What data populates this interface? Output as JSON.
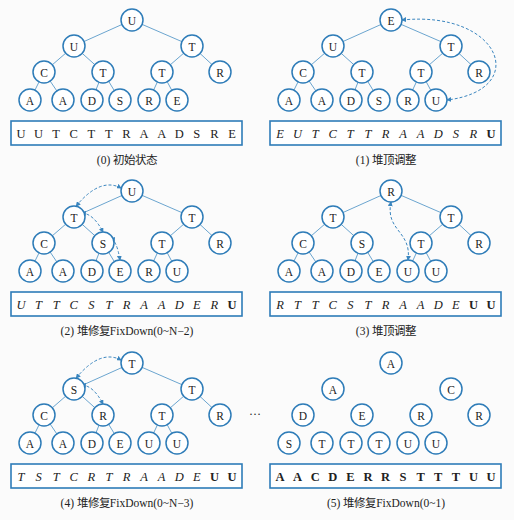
{
  "colors": {
    "node_stroke": "#2e7cb8",
    "edge": "#5a9bc9",
    "text": "#222222"
  },
  "ellipsis": "…",
  "panels": [
    {
      "id": 0,
      "caption": "(0) 初始状态",
      "nodes": [
        "U",
        "U",
        "T",
        "C",
        "T",
        "T",
        "R",
        "A",
        "A",
        "D",
        "S",
        "R",
        "E"
      ],
      "show_edges": true,
      "array": [
        {
          "v": "U",
          "s": "normal"
        },
        {
          "v": "U",
          "s": "normal"
        },
        {
          "v": "T",
          "s": "normal"
        },
        {
          "v": "C",
          "s": "normal"
        },
        {
          "v": "T",
          "s": "normal"
        },
        {
          "v": "T",
          "s": "normal"
        },
        {
          "v": "R",
          "s": "normal"
        },
        {
          "v": "A",
          "s": "normal"
        },
        {
          "v": "A",
          "s": "normal"
        },
        {
          "v": "D",
          "s": "normal"
        },
        {
          "v": "S",
          "s": "normal"
        },
        {
          "v": "R",
          "s": "normal"
        },
        {
          "v": "E",
          "s": "normal"
        }
      ],
      "swaps": []
    },
    {
      "id": 1,
      "caption": "(1) 堆顶调整",
      "nodes": [
        "E",
        "U",
        "T",
        "C",
        "T",
        "T",
        "R",
        "A",
        "A",
        "D",
        "S",
        "R",
        "U"
      ],
      "show_edges": true,
      "array": [
        {
          "v": "E",
          "s": "italic"
        },
        {
          "v": "U",
          "s": "italic"
        },
        {
          "v": "T",
          "s": "italic"
        },
        {
          "v": "C",
          "s": "italic"
        },
        {
          "v": "T",
          "s": "italic"
        },
        {
          "v": "T",
          "s": "italic"
        },
        {
          "v": "R",
          "s": "italic"
        },
        {
          "v": "A",
          "s": "italic"
        },
        {
          "v": "A",
          "s": "italic"
        },
        {
          "v": "D",
          "s": "italic"
        },
        {
          "v": "S",
          "s": "italic"
        },
        {
          "v": "R",
          "s": "italic"
        },
        {
          "v": "U",
          "s": "bold"
        }
      ],
      "swaps": [
        [
          0,
          12
        ]
      ]
    },
    {
      "id": 2,
      "caption": "(2) 堆修复FixDown(0~N−2)",
      "nodes": [
        "U",
        "T",
        "T",
        "C",
        "S",
        "T",
        "R",
        "A",
        "A",
        "D",
        "E",
        "R",
        "U"
      ],
      "show_edges": true,
      "array": [
        {
          "v": "U",
          "s": "italic"
        },
        {
          "v": "T",
          "s": "italic"
        },
        {
          "v": "T",
          "s": "italic"
        },
        {
          "v": "C",
          "s": "italic"
        },
        {
          "v": "S",
          "s": "italic"
        },
        {
          "v": "T",
          "s": "italic"
        },
        {
          "v": "R",
          "s": "italic"
        },
        {
          "v": "A",
          "s": "italic"
        },
        {
          "v": "A",
          "s": "italic"
        },
        {
          "v": "D",
          "s": "italic"
        },
        {
          "v": "E",
          "s": "italic"
        },
        {
          "v": "R",
          "s": "italic"
        },
        {
          "v": "U",
          "s": "bold"
        }
      ],
      "swaps": [
        [
          0,
          1
        ],
        [
          1,
          4
        ],
        [
          4,
          10
        ]
      ]
    },
    {
      "id": 3,
      "caption": "(3) 堆顶调整",
      "nodes": [
        "R",
        "T",
        "T",
        "C",
        "S",
        "T",
        "R",
        "A",
        "A",
        "D",
        "E",
        "U",
        "U"
      ],
      "show_edges": true,
      "array": [
        {
          "v": "R",
          "s": "italic"
        },
        {
          "v": "T",
          "s": "italic"
        },
        {
          "v": "T",
          "s": "italic"
        },
        {
          "v": "C",
          "s": "italic"
        },
        {
          "v": "S",
          "s": "italic"
        },
        {
          "v": "T",
          "s": "italic"
        },
        {
          "v": "R",
          "s": "italic"
        },
        {
          "v": "A",
          "s": "italic"
        },
        {
          "v": "A",
          "s": "italic"
        },
        {
          "v": "D",
          "s": "italic"
        },
        {
          "v": "E",
          "s": "italic"
        },
        {
          "v": "U",
          "s": "bold"
        },
        {
          "v": "U",
          "s": "bold"
        }
      ],
      "swaps": [
        [
          0,
          11
        ]
      ]
    },
    {
      "id": 4,
      "caption": "(4) 堆修复FixDown(0~N−3)",
      "nodes": [
        "T",
        "S",
        "T",
        "C",
        "R",
        "T",
        "R",
        "A",
        "A",
        "D",
        "E",
        "U",
        "U"
      ],
      "show_edges": true,
      "array": [
        {
          "v": "T",
          "s": "italic"
        },
        {
          "v": "S",
          "s": "italic"
        },
        {
          "v": "T",
          "s": "italic"
        },
        {
          "v": "C",
          "s": "italic"
        },
        {
          "v": "R",
          "s": "italic"
        },
        {
          "v": "T",
          "s": "italic"
        },
        {
          "v": "R",
          "s": "italic"
        },
        {
          "v": "A",
          "s": "italic"
        },
        {
          "v": "A",
          "s": "italic"
        },
        {
          "v": "D",
          "s": "italic"
        },
        {
          "v": "E",
          "s": "italic"
        },
        {
          "v": "U",
          "s": "bold"
        },
        {
          "v": "U",
          "s": "bold"
        }
      ],
      "swaps": [
        [
          0,
          1
        ],
        [
          1,
          4
        ]
      ]
    },
    {
      "id": 5,
      "caption": "(5) 堆修复FixDown(0~1)",
      "nodes": [
        "A",
        "A",
        "C",
        "D",
        "E",
        "R",
        "R",
        "S",
        "T",
        "T",
        "T",
        "U",
        "U"
      ],
      "show_edges": false,
      "array": [
        {
          "v": "A",
          "s": "bold"
        },
        {
          "v": "A",
          "s": "bold"
        },
        {
          "v": "C",
          "s": "bold"
        },
        {
          "v": "D",
          "s": "bold"
        },
        {
          "v": "E",
          "s": "bold"
        },
        {
          "v": "R",
          "s": "bold"
        },
        {
          "v": "R",
          "s": "bold"
        },
        {
          "v": "S",
          "s": "bold"
        },
        {
          "v": "T",
          "s": "bold"
        },
        {
          "v": "T",
          "s": "bold"
        },
        {
          "v": "T",
          "s": "bold"
        },
        {
          "v": "U",
          "s": "bold"
        },
        {
          "v": "U",
          "s": "bold"
        }
      ],
      "swaps": []
    }
  ]
}
